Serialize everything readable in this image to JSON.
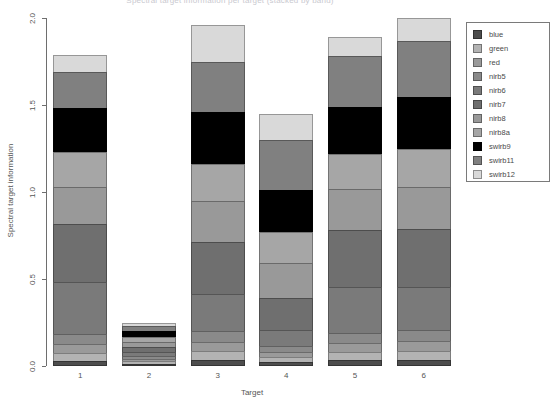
{
  "chart_data": {
    "type": "bar",
    "subtype": "stacked-bar",
    "title": "Spectral target information per target (stacked by band)",
    "xlabel": "Target",
    "ylabel": "Spectral target information",
    "categories": [
      "1",
      "2",
      "3",
      "4",
      "5",
      "6"
    ],
    "ylim": [
      0.0,
      2.0
    ],
    "yticks": [
      "0.0",
      "0.5",
      "1.0",
      "1.5",
      "2.0"
    ],
    "ytick_values": [
      0.0,
      0.5,
      1.0,
      1.5,
      2.0
    ],
    "grid": false,
    "legend_position": "right",
    "legend_title": "",
    "colors": {
      "blue": "#4d4d4d",
      "green": "#b3b3b3",
      "red": "#9a9a9a",
      "nirb5": "#8a8a8a",
      "nirb6": "#7a7a7a",
      "nirb7": "#6f6f6f",
      "nirb8": "#999999",
      "nirb8a": "#a6a6a6",
      "swirb9": "#000000",
      "swirb11": "#808080",
      "swirb12": "#d9d9d9"
    },
    "series": [
      {
        "name": "blue",
        "values": [
          0.03,
          0.012,
          0.035,
          0.022,
          0.032,
          0.033
        ]
      },
      {
        "name": "green",
        "values": [
          0.045,
          0.014,
          0.048,
          0.028,
          0.046,
          0.05
        ]
      },
      {
        "name": "red",
        "values": [
          0.052,
          0.015,
          0.055,
          0.03,
          0.053,
          0.058
        ]
      },
      {
        "name": "nirb5",
        "values": [
          0.058,
          0.016,
          0.062,
          0.034,
          0.06,
          0.064
        ]
      },
      {
        "name": "nirb6",
        "values": [
          0.3,
          0.022,
          0.215,
          0.095,
          0.26,
          0.25
        ]
      },
      {
        "name": "nirb7",
        "values": [
          0.33,
          0.03,
          0.3,
          0.18,
          0.33,
          0.33
        ]
      },
      {
        "name": "nirb8",
        "values": [
          0.215,
          0.028,
          0.235,
          0.2,
          0.235,
          0.245
        ]
      },
      {
        "name": "nirb8a",
        "values": [
          0.2,
          0.03,
          0.21,
          0.18,
          0.2,
          0.215
        ]
      },
      {
        "name": "swirb9",
        "values": [
          0.25,
          0.035,
          0.3,
          0.24,
          0.275,
          0.3
        ]
      },
      {
        "name": "swirb11",
        "values": [
          0.21,
          0.03,
          0.29,
          0.29,
          0.29,
          0.32
        ]
      },
      {
        "name": "swirb12",
        "values": [
          0.1,
          0.018,
          0.21,
          0.151,
          0.109,
          0.135
        ]
      }
    ],
    "totals": [
      1.79,
      0.25,
      1.96,
      1.45,
      1.89,
      2.0
    ]
  },
  "legend": {
    "items": [
      {
        "label": "blue"
      },
      {
        "label": "green"
      },
      {
        "label": "red"
      },
      {
        "label": "nirb5"
      },
      {
        "label": "nirb6"
      },
      {
        "label": "nirb7"
      },
      {
        "label": "nirb8"
      },
      {
        "label": "nirb8a"
      },
      {
        "label": "swirb9"
      },
      {
        "label": "swirb11"
      },
      {
        "label": "swirb12"
      }
    ]
  }
}
